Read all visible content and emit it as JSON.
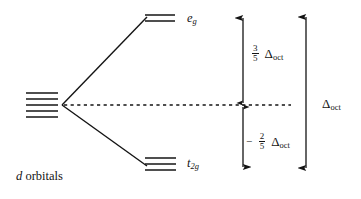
{
  "figure": {
    "caption": {
      "italic_part": "d",
      "rest_part": " orbitals"
    },
    "levels": {
      "eg": {
        "label_main": "e",
        "label_sub": "g",
        "degeneracy": 2,
        "energy_label": "3/5"
      },
      "t2g": {
        "label_main": "t",
        "label_sub": "2g",
        "degeneracy": 3,
        "energy_label": "-2/5"
      },
      "barycenter": {
        "degeneracy": 5,
        "style": "dashed"
      }
    },
    "measures": [
      {
        "name": "upper-splitting",
        "sign": "",
        "numerator": "3",
        "denominator": "5",
        "symbol": "Δ",
        "symbol_sub": "oct"
      },
      {
        "name": "lower-splitting",
        "sign": "−",
        "numerator": "2",
        "denominator": "5",
        "symbol": "Δ",
        "symbol_sub": "oct"
      },
      {
        "name": "total-splitting",
        "sign": "",
        "numerator": "",
        "denominator": "",
        "symbol": "Δ",
        "symbol_sub": "oct"
      }
    ],
    "colors": {
      "ink": "#141414",
      "background": "#ffffff"
    }
  }
}
